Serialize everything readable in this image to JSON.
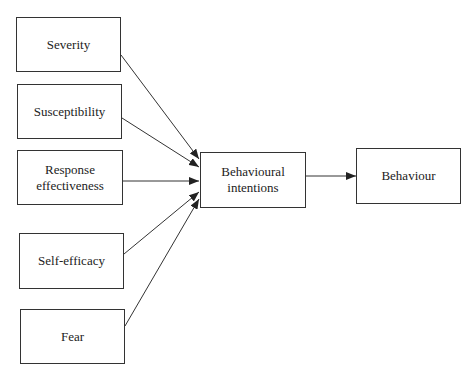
{
  "diagram": {
    "inputs": [
      {
        "label": "Severity"
      },
      {
        "label": "Susceptibility"
      },
      {
        "label": "Response effectiveness",
        "line1": "Response",
        "line2": "effectiveness"
      },
      {
        "label": "Self-efficacy"
      },
      {
        "label": "Fear"
      }
    ],
    "mediator": {
      "label": "Behavioural intentions",
      "line1": "Behavioural",
      "line2": "intentions"
    },
    "outcome": {
      "label": "Behaviour"
    },
    "edges": [
      {
        "from": "Severity",
        "to": "Behavioural intentions"
      },
      {
        "from": "Susceptibility",
        "to": "Behavioural intentions"
      },
      {
        "from": "Response effectiveness",
        "to": "Behavioural intentions"
      },
      {
        "from": "Self-efficacy",
        "to": "Behavioural intentions"
      },
      {
        "from": "Fear",
        "to": "Behavioural intentions"
      },
      {
        "from": "Behavioural intentions",
        "to": "Behaviour"
      }
    ]
  }
}
